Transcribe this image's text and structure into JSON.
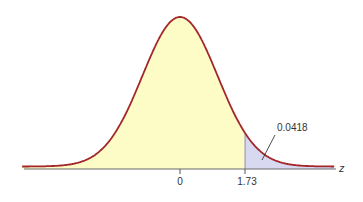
{
  "chart_data": {
    "type": "area",
    "title": "",
    "xlabel": "z",
    "ylabel": "",
    "distribution": {
      "name": "standard normal",
      "mean": 0,
      "sd": 1
    },
    "x_range": [
      -4.2,
      4.1
    ],
    "tick_labels": [
      "0",
      "1.73"
    ],
    "ticks": [
      0,
      1.73
    ],
    "shaded_regions": [
      {
        "from": -4.2,
        "to": 1.73,
        "color": "#fdfbc6",
        "label": "body"
      },
      {
        "from": 1.73,
        "to": 4.1,
        "color": "#d8d9f0",
        "label": "tail",
        "area": 0.0418
      }
    ],
    "annotations": [
      {
        "text": "0.0418",
        "points_to": "tail area right of z = 1.73"
      }
    ],
    "curve_color": "#a3262a",
    "axis_color": "#555555",
    "grid": false,
    "legend": null
  },
  "labels": {
    "tick_0": "0",
    "tick_173": "1.73",
    "area_annotation": "0.0418",
    "axis_variable": "z"
  }
}
